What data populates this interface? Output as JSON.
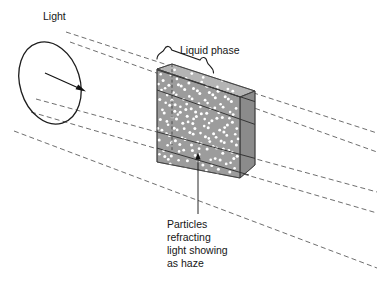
{
  "figure": {
    "title_label": "Light",
    "liquid_label": "Liquid phase",
    "note_lines": [
      "Particles",
      "refracting",
      "light showing",
      "as haze"
    ],
    "icons": {
      "light_source": "ellipse-light-source-icon",
      "direction_arrow": "direction-arrow-icon",
      "brace": "curly-brace-icon",
      "leader_arrow": "leader-arrow-icon"
    },
    "colors": {
      "slab_front": "#9c9c9c",
      "slab_side": "#8b8b8b",
      "slab_top": "#b4b4b4",
      "particle": "#ffffff",
      "ray": "#5e5e5e",
      "ink": "#1d1d1d",
      "background": "#ffffff"
    },
    "ray_count": 5,
    "particle_count": 260
  }
}
